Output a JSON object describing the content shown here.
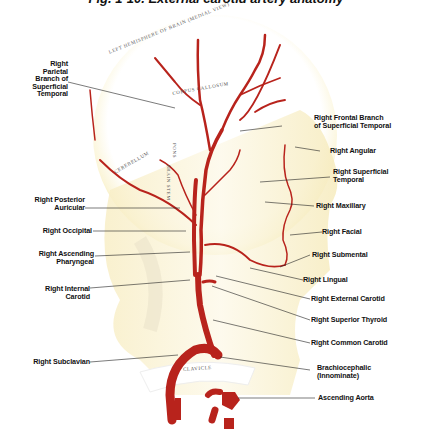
{
  "figure": {
    "title": "Fig. 1-10. External carotid artery anatomy"
  },
  "anatomy_text": {
    "left_hemisphere": "LEFT HEMISPHERE OF BRAIN (MEDIAL VIEW)",
    "corpus_callosum": "CORPUS CALLOSUM",
    "cerebellum": "CEREBELLUM",
    "pons": "PONS",
    "brain_stem": "BRAIN STEM",
    "clavicle": "CLAVICLE"
  },
  "labels_left": [
    {
      "id": "right-parietal",
      "lines": [
        "Right",
        "Parietal",
        "Branch of",
        "Superficial",
        "Temporal"
      ]
    },
    {
      "id": "right-posterior-auricular",
      "lines": [
        "Right Posterior",
        "Auricular"
      ]
    },
    {
      "id": "right-occipital",
      "lines": [
        "Right Occipital"
      ]
    },
    {
      "id": "right-ascending-pharyngeal",
      "lines": [
        "Right Ascending",
        "Pharyngeal"
      ]
    },
    {
      "id": "right-internal-carotid",
      "lines": [
        "Right Internal",
        "Carotid"
      ]
    },
    {
      "id": "right-subclavian",
      "lines": [
        "Right Subclavian"
      ]
    }
  ],
  "labels_right": [
    {
      "id": "right-frontal-branch",
      "lines": [
        "Right Frontal Branch",
        "of Superficial Temporal"
      ]
    },
    {
      "id": "right-angular",
      "lines": [
        "Right Angular"
      ]
    },
    {
      "id": "right-superficial-temporal",
      "lines": [
        "Right Superficial",
        "Temporal"
      ]
    },
    {
      "id": "right-maxillary",
      "lines": [
        "Right Maxillary"
      ]
    },
    {
      "id": "right-facial",
      "lines": [
        "Right Facial"
      ]
    },
    {
      "id": "right-submental",
      "lines": [
        "Right Submental"
      ]
    },
    {
      "id": "right-lingual",
      "lines": [
        "Right Lingual"
      ]
    },
    {
      "id": "right-external-carotid",
      "lines": [
        "Right External Carotid"
      ]
    },
    {
      "id": "right-superior-thyroid",
      "lines": [
        "Right Superior Thyroid"
      ]
    },
    {
      "id": "right-common-carotid",
      "lines": [
        "Right Common Carotid"
      ]
    },
    {
      "id": "brachiocephalic",
      "lines": [
        "Brachiocephalic",
        "(Innominate)"
      ]
    },
    {
      "id": "ascending-aorta",
      "lines": [
        "Ascending Aorta"
      ]
    }
  ],
  "colors": {
    "artery": "#b8231c",
    "skin": "#f6eec9",
    "skin_edge": "#efe19a",
    "leader": "#222222"
  }
}
